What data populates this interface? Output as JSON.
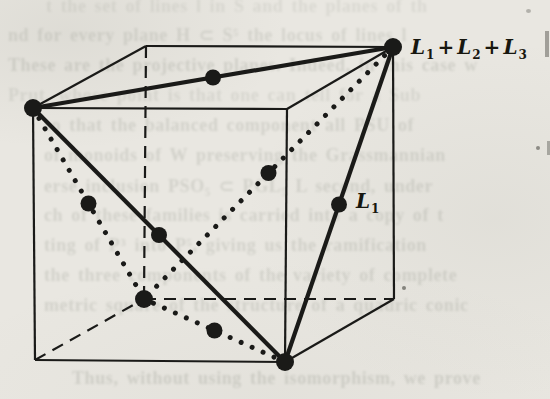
{
  "page": {
    "background_color": "#e9e7e1",
    "ink_color": "#1a1a18",
    "ghost_text_color": "#6f7468"
  },
  "figure": {
    "vertices": {
      "FTL": [
        33,
        108
      ],
      "FTR": [
        287,
        109
      ],
      "BTL": [
        146,
        46
      ],
      "BTR": [
        393,
        47
      ],
      "FBL": [
        35,
        360
      ],
      "FBR": [
        285,
        362
      ],
      "BBL": [
        144,
        299
      ],
      "BBR": [
        394,
        299
      ]
    },
    "solid_edges": [
      [
        "FTL",
        "FTR"
      ],
      [
        "FTL",
        "BTL"
      ],
      [
        "BTL",
        "BTR"
      ],
      [
        "BTR",
        "FTR"
      ],
      [
        "FTL",
        "FBL"
      ],
      [
        "FTR",
        "FBR"
      ],
      [
        "BTR",
        "BBR"
      ],
      [
        "FBL",
        "FBR"
      ],
      [
        "FBR",
        "BBR"
      ]
    ],
    "dashed_edges": [
      [
        "BTL",
        "BBL"
      ],
      [
        "BBL",
        "BBR"
      ],
      [
        "FBL",
        "BBL"
      ]
    ],
    "thick_diagonals": [
      [
        "FTL",
        "BTR"
      ],
      [
        "FTL",
        "FBR"
      ],
      [
        "FBR",
        "BTR"
      ]
    ],
    "dotted_diagonals": [
      [
        "FTL",
        "BBL"
      ],
      [
        "BTR",
        "BBL"
      ],
      [
        "FBR",
        "BBL"
      ]
    ],
    "vertex_points": [
      "FTL",
      "BTR",
      "FBR",
      "BBL"
    ],
    "midpoint_points": [
      [
        "FTL",
        "BTR"
      ],
      [
        "FTL",
        "FBR"
      ],
      [
        "FBR",
        "BTR"
      ],
      [
        "FTL",
        "BBL"
      ],
      [
        "BTR",
        "BBL"
      ],
      [
        "FBR",
        "BBL"
      ]
    ],
    "point_radius_vertex": 9,
    "point_radius_mid": 8,
    "labels": [
      {
        "id": "sum-label",
        "x": 411,
        "y": 54,
        "font_size": 20,
        "parts": [
          {
            "t": "L"
          },
          {
            "t": "1",
            "sub": true
          },
          {
            "t": "+",
            "plus": true
          },
          {
            "t": "L"
          },
          {
            "t": "2",
            "sub": true
          },
          {
            "t": "+",
            "plus": true
          },
          {
            "t": "L"
          },
          {
            "t": "3",
            "sub": true
          }
        ]
      },
      {
        "id": "l1-label",
        "x": 356,
        "y": 208,
        "font_size": 20,
        "parts": [
          {
            "t": "L"
          },
          {
            "t": "1",
            "sub": true
          }
        ]
      }
    ]
  },
  "ghost_text": {
    "lines": [
      {
        "x": 46,
        "y": -4,
        "op": 0.12,
        "t": "t the set of lines l in S and the planes of th"
      },
      {
        "x": 8,
        "y": 24,
        "op": 0.17,
        "t": "nd for every plane H ⊂ S⁵ the locus of lines l"
      },
      {
        "x": 8,
        "y": 55,
        "op": 0.19,
        "t": "These are the projective planes. Indeed, in this case w"
      },
      {
        "x": 8,
        "y": 85,
        "op": 0.14,
        "t": "Prut, whose point is that one can tell for a Sub"
      },
      {
        "x": 44,
        "y": 115,
        "op": 0.18,
        "t": "so that the balanced component all PSU of"
      },
      {
        "x": 44,
        "y": 145,
        "op": 0.18,
        "t": "of monoids of W preserving the Grassmannian"
      },
      {
        "x": 44,
        "y": 175,
        "op": 0.18,
        "t": "erse inclusion PSO₅ ⊂ PGL₅ L second, under"
      },
      {
        "x": 44,
        "y": 205,
        "op": 0.18,
        "t": "ch of these families is carried into a copy of t"
      },
      {
        "x": 44,
        "y": 235,
        "op": 0.18,
        "t": "ting of P³ into P⁵, giving us the ramification"
      },
      {
        "x": 44,
        "y": 265,
        "op": 0.18,
        "t": "the three components of the variety of complete"
      },
      {
        "x": 44,
        "y": 295,
        "op": 0.18,
        "t": "metric square of the structure of a quadric conic"
      },
      {
        "x": 72,
        "y": 368,
        "op": 0.2,
        "t": "Thus, without using the isomorphism, we prove"
      }
    ]
  },
  "artifacts": {
    "specks": [
      {
        "x": 545,
        "y": 31,
        "w": 4,
        "h": 26,
        "o": 0.4,
        "round": false
      },
      {
        "x": 547,
        "y": 141,
        "w": 3,
        "h": 14,
        "o": 0.35,
        "round": false
      },
      {
        "x": 536,
        "y": 146,
        "w": 4,
        "h": 4,
        "o": 0.5,
        "round": true
      },
      {
        "x": 402,
        "y": 286,
        "w": 4,
        "h": 4,
        "o": 0.55,
        "round": true
      },
      {
        "x": 526,
        "y": 9,
        "w": 5,
        "h": 4,
        "o": 0.3,
        "round": true
      }
    ]
  }
}
